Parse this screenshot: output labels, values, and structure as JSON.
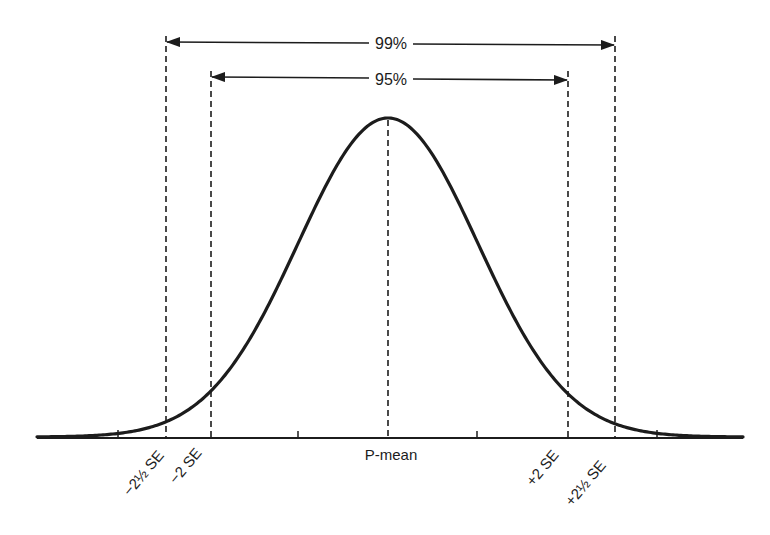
{
  "diagram": {
    "type": "normal_distribution_confidence_intervals",
    "curve": {
      "shape": "normal (bell) curve",
      "mean_label": "P-mean"
    },
    "intervals": [
      {
        "label": "99%",
        "from": "-2½ SE",
        "to": "+2½ SE"
      },
      {
        "label": "95%",
        "from": "-2 SE",
        "to": "+2 SE"
      }
    ],
    "axis_labels": {
      "minus_2_5_se": "−2½ SE",
      "minus_2_se": "−2 SE",
      "mean": "P-mean",
      "plus_2_se": "+2 SE",
      "plus_2_5_se": "+2½ SE"
    },
    "tick_marks_se": [
      -3,
      -1,
      1,
      3
    ],
    "colors": {
      "ink": "#1c1c1c",
      "background": "#ffffff"
    }
  }
}
